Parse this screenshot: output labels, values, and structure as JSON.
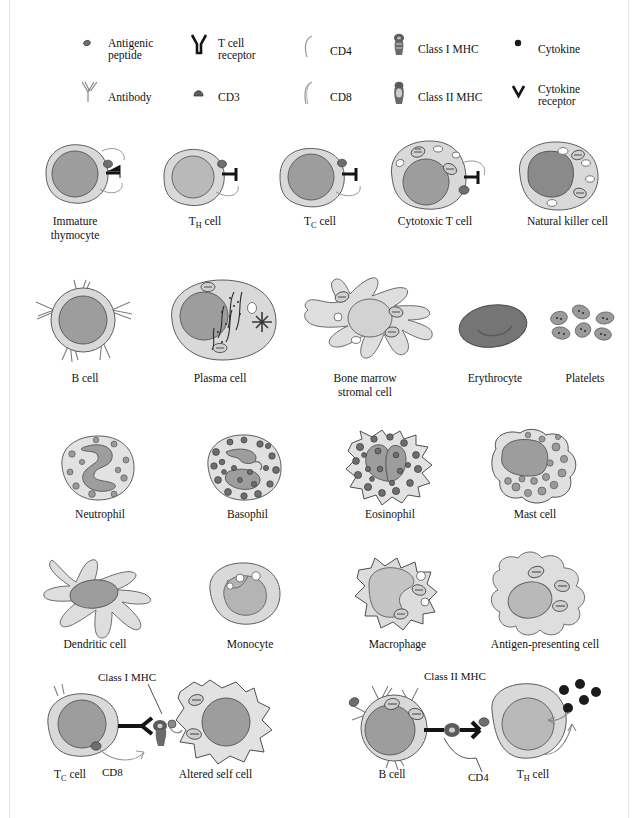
{
  "figure": {
    "background": "#ffffff",
    "palette": {
      "cytoplasm": "#d9d9d9",
      "nucleus": "#9d9d9d",
      "dark_granule": "#6e6e6e",
      "erythrocyte": "#757575",
      "ink": "#141414",
      "outline": "#5d5d5d"
    }
  },
  "legend": {
    "items": [
      {
        "icon": "antigenic-peptide-icon",
        "label_lines": [
          "Antigenic",
          "peptide"
        ]
      },
      {
        "icon": "t-cell-receptor-icon",
        "label_lines": [
          "T cell",
          "receptor"
        ]
      },
      {
        "icon": "cd4-icon",
        "label_lines": [
          "CD4"
        ]
      },
      {
        "icon": "class-i-mhc-icon",
        "label_lines": [
          "Class I MHC"
        ]
      },
      {
        "icon": "cytokine-icon",
        "label_lines": [
          "Cytokine"
        ]
      },
      {
        "icon": "antibody-icon",
        "label_lines": [
          "Antibody"
        ]
      },
      {
        "icon": "cd3-icon",
        "label_lines": [
          "CD3"
        ]
      },
      {
        "icon": "cd8-icon",
        "label_lines": [
          "CD8"
        ]
      },
      {
        "icon": "class-ii-mhc-icon",
        "label_lines": [
          "Class II MHC"
        ]
      },
      {
        "icon": "cytokine-receptor-icon",
        "label_lines": [
          "Cytokine",
          "receptor"
        ]
      }
    ]
  },
  "rows": [
    {
      "name": "lymphocyte-row",
      "cells": [
        {
          "id": "immature-thymocyte",
          "label_lines": [
            "Immature",
            "thymocyte"
          ]
        },
        {
          "id": "th-cell",
          "label_lines": [
            "TH cell"
          ],
          "sub": "H",
          "base": "T",
          "tail": " cell"
        },
        {
          "id": "tc-cell",
          "label_lines": [
            "TC cell"
          ],
          "sub": "C",
          "base": "T",
          "tail": " cell"
        },
        {
          "id": "cytotoxic-t-cell",
          "label_lines": [
            "Cytotoxic T cell"
          ]
        },
        {
          "id": "natural-killer-cell",
          "label_lines": [
            "Natural killer cell"
          ]
        }
      ]
    },
    {
      "name": "b-lineage-row",
      "cells": [
        {
          "id": "b-cell",
          "label_lines": [
            "B cell"
          ]
        },
        {
          "id": "plasma-cell",
          "label_lines": [
            "Plasma cell"
          ]
        },
        {
          "id": "bone-marrow-stromal-cell",
          "label_lines": [
            "Bone marrow",
            "stromal cell"
          ]
        },
        {
          "id": "erythrocyte",
          "label_lines": [
            "Erythrocyte"
          ]
        },
        {
          "id": "platelets",
          "label_lines": [
            "Platelets"
          ]
        }
      ]
    },
    {
      "name": "granulocyte-row",
      "cells": [
        {
          "id": "neutrophil",
          "label_lines": [
            "Neutrophil"
          ]
        },
        {
          "id": "basophil",
          "label_lines": [
            "Basophil"
          ]
        },
        {
          "id": "eosinophil",
          "label_lines": [
            "Eosinophil"
          ]
        },
        {
          "id": "mast-cell",
          "label_lines": [
            "Mast cell"
          ]
        }
      ]
    },
    {
      "name": "phagocyte-row",
      "cells": [
        {
          "id": "dendritic-cell",
          "label_lines": [
            "Dendritic cell"
          ]
        },
        {
          "id": "monocyte",
          "label_lines": [
            "Monocyte"
          ]
        },
        {
          "id": "macrophage",
          "label_lines": [
            "Macrophage"
          ]
        },
        {
          "id": "antigen-presenting-cell",
          "label_lines": [
            "Antigen-presenting cell"
          ]
        }
      ]
    }
  ],
  "interactions": {
    "left": {
      "name": "cytotoxic-interaction",
      "annotation": "Class I MHC",
      "coreceptor": "CD8",
      "effector_label_base": "T",
      "effector_label_sub": "C",
      "effector_label_tail": " cell",
      "target_label": "Altered self cell"
    },
    "right": {
      "name": "helper-interaction",
      "annotation": "Class II MHC",
      "coreceptor": "CD4",
      "presenter_label": "B cell",
      "helper_label_base": "T",
      "helper_label_sub": "H",
      "helper_label_tail": " cell",
      "cytokine_count": 5
    }
  }
}
